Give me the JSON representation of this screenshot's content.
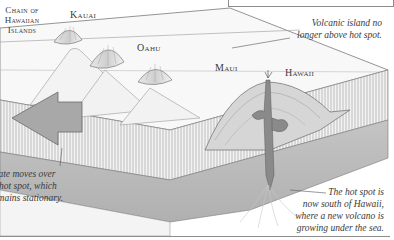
{
  "figure": {
    "title_label": "Chain of Hawaiian Islands",
    "title_lines": [
      "Chain of",
      "Hawaiian",
      "Islands"
    ],
    "islands": [
      {
        "name": "Kauai"
      },
      {
        "name": "Oahu"
      },
      {
        "name": "Maui"
      },
      {
        "name": "Hawaii"
      }
    ],
    "captions": {
      "volcanic_island": [
        "Volcanic island no",
        "longer above hot spot."
      ],
      "plate_moves": [
        "Plate moves over",
        "hot spot, which",
        "remains stationary."
      ],
      "hot_spot": [
        "The hot spot is",
        "now south of Hawaii,",
        "where a new volcano is",
        "growing under the sea."
      ]
    },
    "colors": {
      "line": "#6a6a6a",
      "crust_hatch": "#9a9a9a",
      "mantle": "#b8b8b8",
      "arrow": "#a8a8a8",
      "magma": "#7a7a7a"
    }
  }
}
